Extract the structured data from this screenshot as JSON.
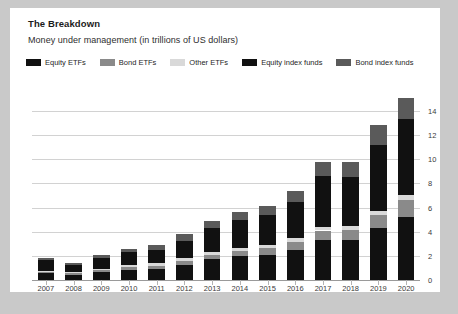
{
  "card": {
    "title": "The Breakdown",
    "subtitle": "Money under management (in trillions of US dollars)"
  },
  "legend": [
    {
      "label": "Equity ETFs",
      "color": "#111111"
    },
    {
      "label": "Bond ETFs",
      "color": "#8a8a8a"
    },
    {
      "label": "Other ETFs",
      "color": "#d9d9d9"
    },
    {
      "label": "Equity index funds",
      "color": "#111111"
    },
    {
      "label": "Bond index funds",
      "color": "#5a5a5a"
    }
  ],
  "chart_data": {
    "type": "bar",
    "stacked": true,
    "title": "The Breakdown",
    "subtitle": "Money under management (in trillions of US dollars)",
    "xlabel": "",
    "ylabel": "",
    "ylim": [
      0,
      15.4
    ],
    "yticks": [
      0,
      2,
      4,
      6,
      8,
      10,
      12,
      14
    ],
    "grid": true,
    "legend_position": "top",
    "categories": [
      "2007",
      "2008",
      "2009",
      "2010",
      "2011",
      "2012",
      "2013",
      "2014",
      "2015",
      "2016",
      "2017",
      "2018",
      "2019",
      "2020"
    ],
    "series": [
      {
        "name": "Equity ETFs",
        "color": "#111111",
        "values": [
          0.6,
          0.45,
          0.65,
          0.85,
          0.95,
          1.25,
          1.7,
          1.95,
          2.1,
          2.5,
          3.3,
          3.3,
          4.3,
          5.2
        ]
      },
      {
        "name": "Bond ETFs",
        "color": "#8a8a8a",
        "values": [
          0.05,
          0.1,
          0.15,
          0.2,
          0.25,
          0.3,
          0.35,
          0.45,
          0.55,
          0.65,
          0.8,
          0.85,
          1.1,
          1.4
        ]
      },
      {
        "name": "Other ETFs",
        "color": "#d9d9d9",
        "values": [
          0.1,
          0.1,
          0.15,
          0.2,
          0.2,
          0.25,
          0.25,
          0.25,
          0.25,
          0.3,
          0.3,
          0.3,
          0.35,
          0.4
        ]
      },
      {
        "name": "Equity index funds",
        "color": "#111111",
        "values": [
          0.9,
          0.6,
          0.85,
          1.05,
          1.1,
          1.45,
          2.0,
          2.3,
          2.45,
          3.0,
          4.25,
          4.1,
          5.4,
          6.3
        ]
      },
      {
        "name": "Bond index funds",
        "color": "#5a5a5a",
        "values": [
          0.15,
          0.15,
          0.25,
          0.3,
          0.4,
          0.55,
          0.55,
          0.7,
          0.8,
          0.95,
          1.15,
          1.25,
          1.65,
          1.8
        ]
      }
    ],
    "totals": [
      1.8,
      1.4,
      2.05,
      2.6,
      2.9,
      3.8,
      4.85,
      5.65,
      6.15,
      7.4,
      9.8,
      9.8,
      12.8,
      15.1
    ]
  }
}
